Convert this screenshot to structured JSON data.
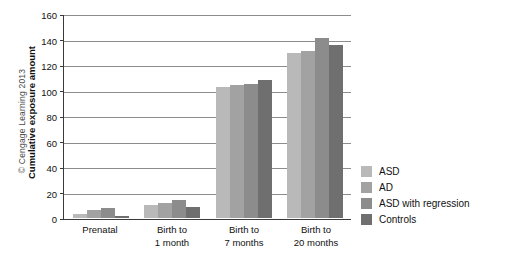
{
  "credit": {
    "text": "© Cengage Learning 2013"
  },
  "chart_data": {
    "type": "bar",
    "title": "",
    "xlabel": "",
    "ylabel": "Cumulative exposure amount",
    "ylim": [
      0,
      160
    ],
    "yticks": [
      0,
      20,
      40,
      60,
      80,
      100,
      120,
      140,
      160
    ],
    "grid": true,
    "legend_position": "right",
    "categories": [
      "Prenatal",
      "Birth to\n1 month",
      "Birth to\n7 months",
      "Birth to\n20 months"
    ],
    "category_lines": [
      [
        "Prenatal"
      ],
      [
        "Birth to",
        "1 month"
      ],
      [
        "Birth to",
        "7 months"
      ],
      [
        "Birth to",
        "20 months"
      ]
    ],
    "series": [
      {
        "name": "ASD",
        "color": "#b9b9b9",
        "values": [
          3,
          10,
          103,
          130
        ]
      },
      {
        "name": "AD",
        "color": "#a2a2a2",
        "values": [
          6,
          12,
          105,
          132
        ]
      },
      {
        "name": "ASD with regression",
        "color": "#8c8c8c",
        "values": [
          8,
          14.5,
          106,
          142
        ]
      },
      {
        "name": "Controls",
        "color": "#6f6f6f",
        "values": [
          1.5,
          9,
          108.5,
          136
        ]
      }
    ]
  }
}
